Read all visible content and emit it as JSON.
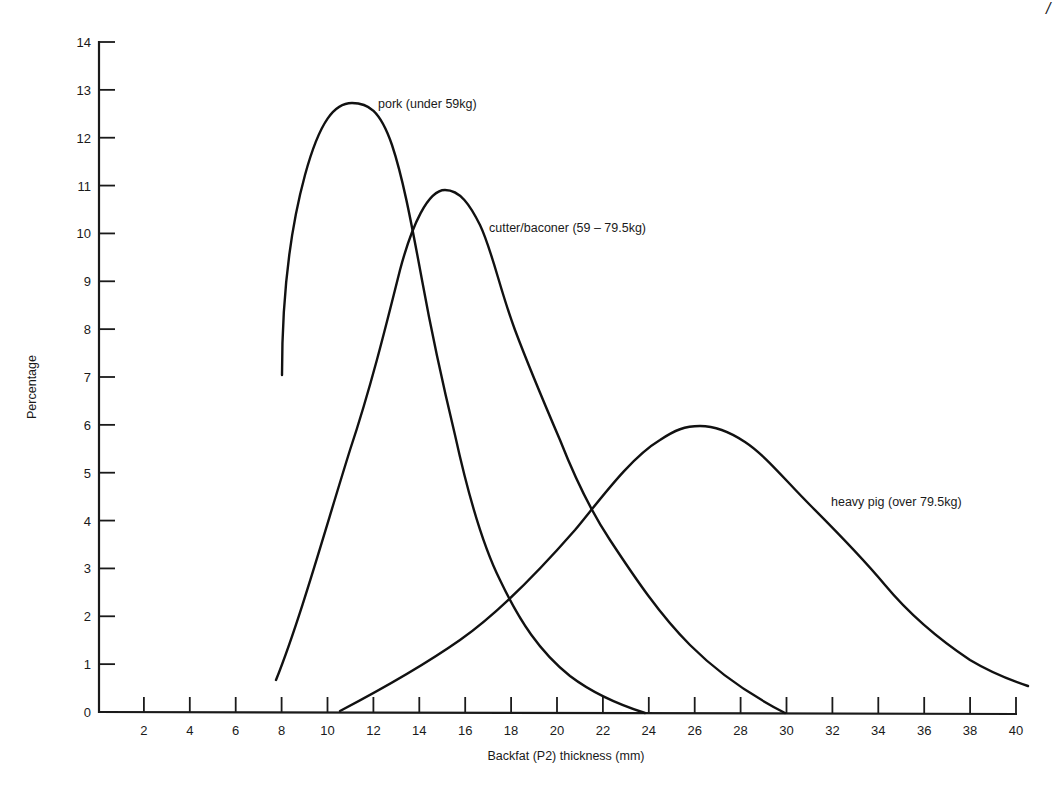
{
  "chart_data": {
    "type": "line",
    "title": "",
    "xlabel": "Backfat (P2) thickness (mm)",
    "ylabel": "Percentage",
    "xlim": [
      0,
      40
    ],
    "ylim": [
      0,
      14
    ],
    "x_ticks": [
      2,
      4,
      6,
      8,
      10,
      12,
      14,
      16,
      18,
      20,
      22,
      24,
      26,
      28,
      30,
      32,
      34,
      36,
      38,
      40
    ],
    "y_ticks": [
      0,
      1,
      2,
      3,
      4,
      5,
      6,
      7,
      8,
      9,
      10,
      11,
      12,
      13,
      14
    ],
    "grid": false,
    "legend": "inline labels next to curves",
    "series": [
      {
        "name": "pork (under 59kg)",
        "x": [
          8,
          8.5,
          9,
          10,
          11,
          12,
          13,
          14,
          15,
          16,
          17,
          18,
          19,
          20,
          21,
          22,
          23,
          23.7
        ],
        "values": [
          7.1,
          9.6,
          11.0,
          12.4,
          12.7,
          12.3,
          11.0,
          9.0,
          6.6,
          4.6,
          3.2,
          2.2,
          1.5,
          0.9,
          0.55,
          0.3,
          0.1,
          0
        ]
      },
      {
        "name": "cutter/baconer (59 – 79.5kg)",
        "x": [
          7.8,
          9,
          10,
          11,
          12,
          13,
          14,
          15,
          16,
          17,
          18,
          19,
          20,
          21,
          22,
          23,
          24,
          25,
          26,
          27,
          28,
          29,
          29.8
        ],
        "values": [
          0.7,
          2.3,
          3.9,
          5.6,
          7.3,
          9.0,
          10.5,
          10.9,
          10.2,
          8.6,
          7.1,
          5.8,
          4.8,
          3.9,
          3.1,
          2.4,
          1.8,
          1.3,
          0.9,
          0.55,
          0.3,
          0.1,
          0
        ]
      },
      {
        "name": "heavy pig (over 79.5kg)",
        "x": [
          10.6,
          12,
          14,
          16,
          18,
          20,
          21,
          22,
          24,
          26,
          28,
          30,
          32,
          34,
          36,
          38,
          40.5
        ],
        "values": [
          0.05,
          0.4,
          1.0,
          1.8,
          2.8,
          3.8,
          4.4,
          4.9,
          5.7,
          6.0,
          5.8,
          5.1,
          4.2,
          3.0,
          2.0,
          1.2,
          0.55
        ]
      }
    ],
    "annotations": [
      {
        "text": "pork (under 59kg)",
        "near_series": 0
      },
      {
        "text": "cutter/baconer (59 – 79.5kg)",
        "near_series": 1
      },
      {
        "text": "heavy pig (over 79.5kg)",
        "near_series": 2
      }
    ]
  },
  "labels": {
    "x_axis_title": "Backfat (P2) thickness (mm)",
    "y_axis_title": "Percentage",
    "pork": "pork (under 59kg)",
    "cutter": "cutter/baconer (59 – 79.5kg)",
    "heavy": "heavy pig (over 79.5kg)",
    "corner_mark": "/"
  },
  "y_tick_labels": [
    "0",
    "1",
    "2",
    "3",
    "4",
    "5",
    "6",
    "7",
    "8",
    "9",
    "10",
    "11",
    "12",
    "13",
    "14"
  ],
  "x_tick_labels": [
    "2",
    "4",
    "6",
    "8",
    "10",
    "12",
    "14",
    "16",
    "18",
    "20",
    "22",
    "24",
    "26",
    "28",
    "30",
    "32",
    "34",
    "36",
    "38",
    "40"
  ]
}
